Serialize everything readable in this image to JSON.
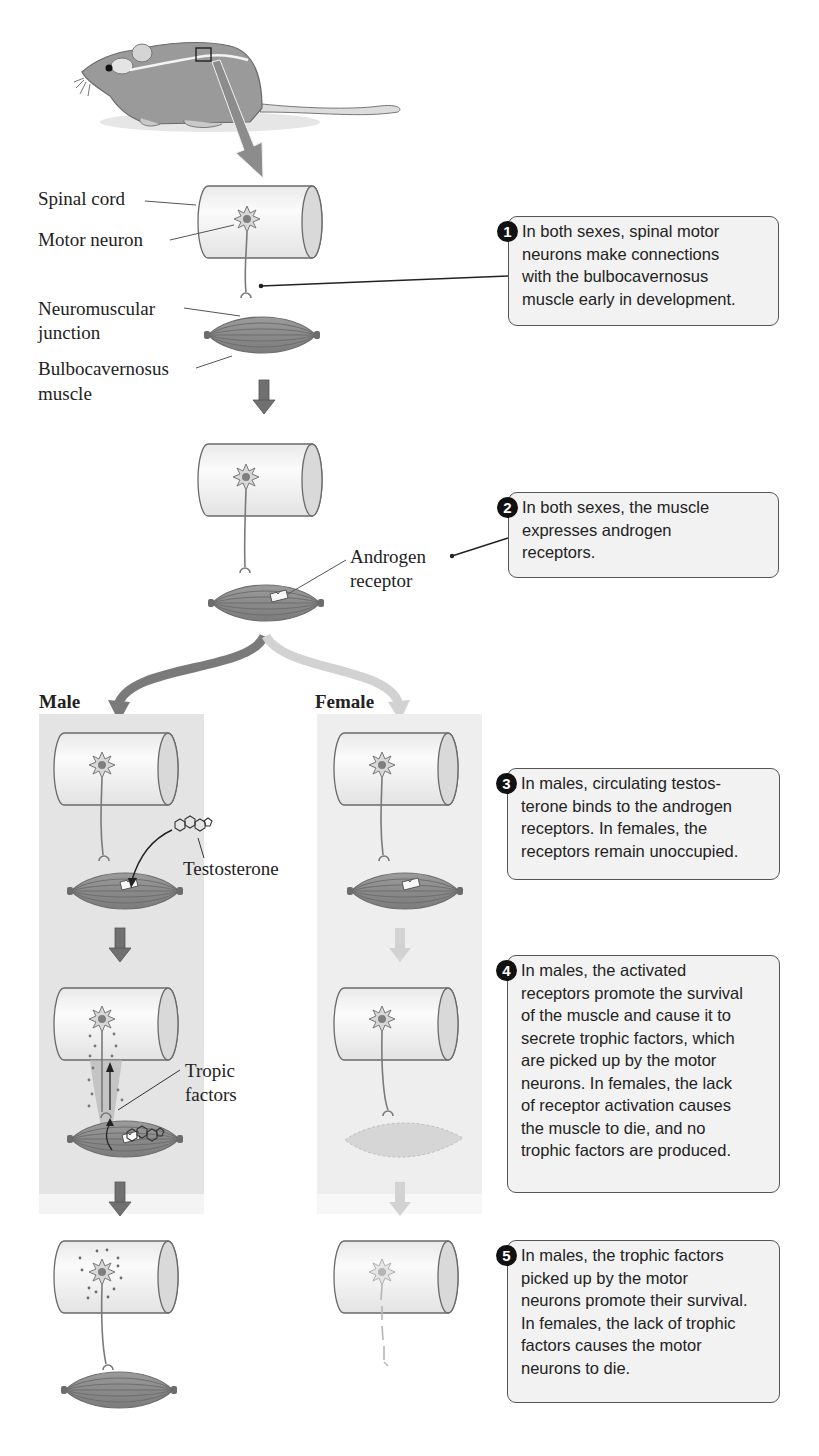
{
  "figure": {
    "colors": {
      "male_panel_bg": "#e4e4e4",
      "female_panel_bg": "#eeeeee",
      "muscle": "#8a8a8a",
      "neuron": "#9a9a9a",
      "cylinder_fill": "#f4f4f4",
      "callout_bg": "#f2f2f2",
      "male_arrow": "#7a7a7a",
      "female_arrow": "#cfcfcf"
    }
  },
  "labels": {
    "spinal_cord": "Spinal cord",
    "motor_neuron": "Motor neuron",
    "neuromuscular_junction_1": "Neuromuscular",
    "neuromuscular_junction_2": "junction",
    "bulbocavernosus_1": "Bulbocavernosus",
    "bulbocavernosus_2": "muscle",
    "androgen_receptor_1": "Androgen",
    "androgen_receptor_2": "receptor",
    "male": "Male",
    "female": "Female",
    "testosterone": "Testosterone",
    "tropic_factors_1": "Tropic",
    "tropic_factors_2": "factors"
  },
  "steps": [
    {
      "number": "1",
      "lines": [
        "In both sexes, spinal motor",
        "neurons make connections",
        "with the bulbocavernosus",
        "muscle early in development."
      ]
    },
    {
      "number": "2",
      "lines": [
        "In both sexes, the muscle",
        "expresses androgen",
        "receptors."
      ]
    },
    {
      "number": "3",
      "lines": [
        "In males, circulating testos-",
        "terone binds to the androgen",
        "receptors. In females, the",
        "receptors remain unoccupied."
      ]
    },
    {
      "number": "4",
      "lines": [
        "In males, the activated",
        "receptors promote the survival",
        "of the muscle and cause it to",
        "secrete trophic factors, which",
        "are picked up by the motor",
        "neurons. In females, the lack",
        "of receptor activation causes",
        "the muscle to die, and no",
        "trophic factors are produced."
      ]
    },
    {
      "number": "5",
      "lines": [
        "In males, the trophic factors",
        "picked up by the motor",
        "neurons promote their survival.",
        "In females, the lack of trophic",
        "factors causes the motor",
        "neurons to die."
      ]
    }
  ]
}
